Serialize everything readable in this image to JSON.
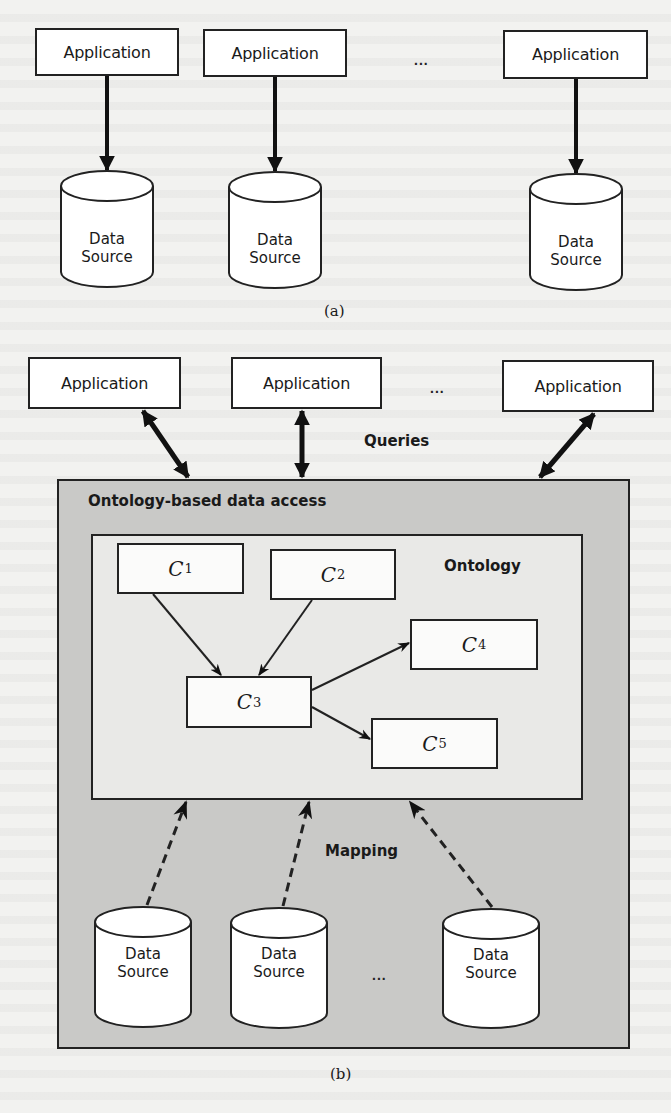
{
  "figure_a": {
    "caption": "(a)",
    "applications": [
      {
        "label": "Application"
      },
      {
        "label": "Application"
      },
      {
        "label": "Application"
      }
    ],
    "ellipsis": "...",
    "data_sources": [
      {
        "line1": "Data",
        "line2": "Source"
      },
      {
        "line1": "Data",
        "line2": "Source"
      },
      {
        "line1": "Data",
        "line2": "Source"
      }
    ]
  },
  "figure_b": {
    "caption": "(b)",
    "applications": [
      {
        "label": "Application"
      },
      {
        "label": "Application"
      },
      {
        "label": "Application"
      }
    ],
    "ellipsis_top": "...",
    "queries_label": "Queries",
    "obda_label": "Ontology-based data access",
    "ontology_label": "Ontology",
    "concepts": [
      {
        "name": "C",
        "sub": "1"
      },
      {
        "name": "C",
        "sub": "2"
      },
      {
        "name": "C",
        "sub": "3"
      },
      {
        "name": "C",
        "sub": "4"
      },
      {
        "name": "C",
        "sub": "5"
      }
    ],
    "mapping_label": "Mapping",
    "ellipsis_bottom": "...",
    "data_sources": [
      {
        "line1": "Data",
        "line2": "Source"
      },
      {
        "line1": "Data",
        "line2": "Source"
      },
      {
        "line1": "Data",
        "line2": "Source"
      }
    ]
  },
  "colors": {
    "outer_fill": "#c9c9c7",
    "inner_fill": "#e9e9e7",
    "stroke": "#222222"
  }
}
